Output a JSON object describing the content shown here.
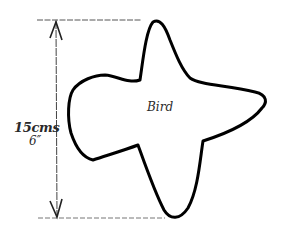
{
  "diagram": {
    "shape_name": "Bird",
    "dimension": {
      "metric": "15cms",
      "imperial": "6″"
    },
    "colors": {
      "outline": "#000000",
      "guide": "#555555",
      "background": "#ffffff"
    }
  }
}
